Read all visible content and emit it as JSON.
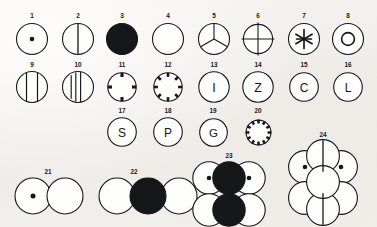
{
  "plate": {
    "title": "Bead and disc type plate",
    "background_color": "#f3f1ee",
    "ink_color": "#16171a",
    "width": 377,
    "height": 227,
    "label_count": 24
  },
  "figures": [
    {
      "id": 1,
      "label": "1",
      "kind": "single-circle",
      "fill": "white",
      "motif": "center-dot",
      "motif_text": "",
      "x": 32,
      "y": 39,
      "r": 17,
      "label_x": 32,
      "label_y": 16
    },
    {
      "id": 2,
      "label": "2",
      "kind": "single-circle",
      "fill": "white",
      "motif": "vertical-line",
      "motif_text": "",
      "x": 78,
      "y": 39,
      "r": 17,
      "label_x": 78,
      "label_y": 16
    },
    {
      "id": 3,
      "label": "3",
      "kind": "single-circle",
      "fill": "black",
      "motif": "solid",
      "motif_text": "",
      "x": 122,
      "y": 39,
      "r": 17,
      "label_x": 122,
      "label_y": 16
    },
    {
      "id": 4,
      "label": "4",
      "kind": "single-circle",
      "fill": "white",
      "motif": "plain",
      "motif_text": "",
      "x": 168,
      "y": 39,
      "r": 17,
      "label_x": 168,
      "label_y": 16
    },
    {
      "id": 5,
      "label": "5",
      "kind": "single-circle",
      "fill": "white",
      "motif": "tri-radial",
      "motif_text": "",
      "x": 214,
      "y": 39,
      "r": 17,
      "label_x": 214,
      "label_y": 16
    },
    {
      "id": 6,
      "label": "6",
      "kind": "single-circle",
      "fill": "white",
      "motif": "cross",
      "motif_text": "",
      "x": 258,
      "y": 39,
      "r": 17,
      "label_x": 258,
      "label_y": 16
    },
    {
      "id": 7,
      "label": "7",
      "kind": "single-circle",
      "fill": "white",
      "motif": "asterisk",
      "motif_text": "",
      "x": 304,
      "y": 39,
      "r": 17,
      "label_x": 304,
      "label_y": 16
    },
    {
      "id": 8,
      "label": "8",
      "kind": "single-circle",
      "fill": "white",
      "motif": "concentric-ring",
      "motif_text": "",
      "x": 348,
      "y": 39,
      "r": 17,
      "label_x": 348,
      "label_y": 16
    },
    {
      "id": 9,
      "label": "9",
      "kind": "single-circle",
      "fill": "white",
      "motif": "two-vertical-lines",
      "motif_text": "",
      "x": 32,
      "y": 87,
      "r": 17,
      "label_x": 32,
      "label_y": 65
    },
    {
      "id": 10,
      "label": "10",
      "kind": "single-circle",
      "fill": "white",
      "motif": "three-vertical-lines",
      "motif_text": "",
      "x": 78,
      "y": 87,
      "r": 17,
      "label_x": 78,
      "label_y": 65
    },
    {
      "id": 11,
      "label": "11",
      "kind": "single-circle",
      "fill": "white",
      "motif": "four-notches",
      "motif_text": "",
      "x": 122,
      "y": 87,
      "r": 17,
      "label_x": 122,
      "label_y": 65
    },
    {
      "id": 12,
      "label": "12",
      "kind": "single-circle",
      "fill": "white",
      "motif": "eight-notches",
      "motif_text": "",
      "x": 168,
      "y": 87,
      "r": 17,
      "label_x": 168,
      "label_y": 65
    },
    {
      "id": 13,
      "label": "13",
      "kind": "single-circle",
      "fill": "white",
      "motif": "letter",
      "motif_text": "I",
      "x": 214,
      "y": 87,
      "r": 17,
      "label_x": 214,
      "label_y": 65
    },
    {
      "id": 14,
      "label": "14",
      "kind": "single-circle",
      "fill": "white",
      "motif": "letter",
      "motif_text": "Z",
      "x": 258,
      "y": 87,
      "r": 17,
      "label_x": 258,
      "label_y": 65
    },
    {
      "id": 15,
      "label": "15",
      "kind": "single-circle",
      "fill": "white",
      "motif": "letter",
      "motif_text": "C",
      "x": 304,
      "y": 87,
      "r": 17,
      "label_x": 304,
      "label_y": 65
    },
    {
      "id": 16,
      "label": "16",
      "kind": "single-circle",
      "fill": "white",
      "motif": "letter",
      "motif_text": "L",
      "x": 348,
      "y": 87,
      "r": 17,
      "label_x": 348,
      "label_y": 65
    },
    {
      "id": 17,
      "label": "17",
      "kind": "single-circle",
      "fill": "white",
      "motif": "letter",
      "motif_text": "S",
      "x": 122,
      "y": 132,
      "r": 16,
      "label_x": 122,
      "label_y": 111
    },
    {
      "id": 18,
      "label": "18",
      "kind": "single-circle",
      "fill": "white",
      "motif": "letter",
      "motif_text": "P",
      "x": 168,
      "y": 132,
      "r": 16,
      "label_x": 168,
      "label_y": 111
    },
    {
      "id": 19,
      "label": "19",
      "kind": "single-circle",
      "fill": "white",
      "motif": "letter",
      "motif_text": "G",
      "x": 213,
      "y": 132,
      "r": 16,
      "label_x": 213,
      "label_y": 111
    },
    {
      "id": 20,
      "label": "20",
      "kind": "single-circle",
      "fill": "white",
      "motif": "twelve-notches",
      "motif_text": "",
      "x": 258,
      "y": 132,
      "r": 16,
      "label_x": 258,
      "label_y": 111
    },
    {
      "id": 21,
      "label": "21",
      "kind": "pair",
      "fill": "white",
      "motif": "dot-plain",
      "motif_text": "",
      "x": 47,
      "y": 194,
      "r": 18,
      "label_x": 47,
      "label_y": 170
    },
    {
      "id": 22,
      "label": "22",
      "kind": "triple",
      "fill": "mixed",
      "motif": "plain-solid-plain",
      "motif_text": "",
      "x": 133,
      "y": 194,
      "r": 18,
      "label_x": 133,
      "label_y": 170
    },
    {
      "id": 23,
      "label": "23",
      "kind": "cluster-six",
      "fill": "mixed",
      "motif": "two-by-three-grid",
      "motif_text": "",
      "x": 228,
      "y": 190,
      "r": 17,
      "label_x": 228,
      "label_y": 155
    },
    {
      "id": 24,
      "label": "24",
      "kind": "cluster-seven",
      "fill": "mixed",
      "motif": "hexagonal-rosette",
      "motif_text": "",
      "x": 322,
      "y": 178,
      "r": 17,
      "label_x": 322,
      "label_y": 134
    }
  ]
}
